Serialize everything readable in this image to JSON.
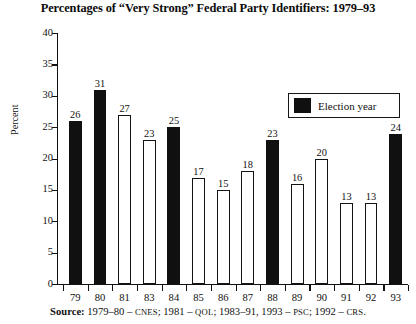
{
  "chart_data": {
    "type": "bar",
    "title": "Percentages of “Very Strong” Federal Party Identifiers: 1979–93",
    "xlabel": "",
    "ylabel": "Percent",
    "ylim": [
      0,
      40
    ],
    "ytick_step": 5,
    "yticks": [
      "0",
      "5",
      "10",
      "15",
      "20",
      "25",
      "30",
      "35",
      "40"
    ],
    "grid": false,
    "categories": [
      "79",
      "80",
      "81",
      "83",
      "84",
      "85",
      "86",
      "87",
      "88",
      "89",
      "90",
      "91",
      "92",
      "93"
    ],
    "values": [
      26,
      31,
      27,
      23,
      25,
      17,
      15,
      18,
      23,
      16,
      20,
      13,
      13,
      24
    ],
    "bar_styles": [
      "filled",
      "filled",
      "hollow",
      "hollow",
      "filled",
      "hollow",
      "hollow",
      "hollow",
      "filled",
      "hollow",
      "hollow",
      "hollow",
      "hollow",
      "filled"
    ],
    "legend": {
      "position": "upper-right",
      "entries": [
        {
          "label": "Election year",
          "style": "filled",
          "color": "#101010"
        }
      ]
    },
    "colors": {
      "election_year_bar": "#101010",
      "non_election_bar": "#ffffff",
      "bar_outline": "#141414",
      "axis": "#111111",
      "text": "#111111"
    },
    "annotations": {
      "source_label": "Source:",
      "source_text_parts": [
        {
          "text": "1979–80 – ",
          "style": "normal"
        },
        {
          "text": "CNES",
          "style": "smallcaps"
        },
        {
          "text": "; 1981 – ",
          "style": "normal"
        },
        {
          "text": "QOL",
          "style": "smallcaps"
        },
        {
          "text": "; 1983–91, 1993 – ",
          "style": "normal"
        },
        {
          "text": "PSC",
          "style": "smallcaps"
        },
        {
          "text": "; 1992 – ",
          "style": "normal"
        },
        {
          "text": "CRS",
          "style": "smallcaps"
        },
        {
          "text": ".",
          "style": "normal"
        }
      ]
    }
  },
  "figure": {
    "title": "Percentages of “Very Strong” Federal Party Identifiers: 1979–93",
    "y_axis_title": "Percent",
    "legend_label": "Election year",
    "source_label": "Source:"
  }
}
